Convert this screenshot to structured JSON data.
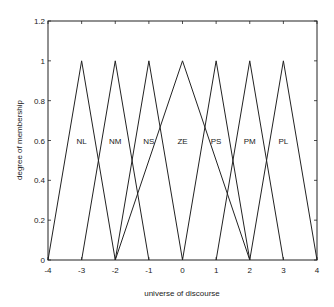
{
  "chart_data": {
    "type": "line",
    "title": "",
    "xlabel": "universe of discourse",
    "ylabel": "degree of membership",
    "xlim": [
      -4,
      4
    ],
    "ylim": [
      0,
      1.2
    ],
    "xticks": [
      -4,
      -3,
      -2,
      -1,
      0,
      1,
      2,
      3,
      4
    ],
    "xtick_labels": [
      "-4",
      "-3",
      "-2",
      "-1",
      "0",
      "1",
      "2",
      "3",
      "4"
    ],
    "yticks": [
      0,
      0.2,
      0.4,
      0.6,
      0.8,
      1,
      1.2
    ],
    "ytick_labels": [
      "0",
      "0.2",
      "0.4",
      "0.6",
      "0.8",
      "1",
      "1.2"
    ],
    "grid": false,
    "legend": "none (labels placed inside plot)",
    "series": [
      {
        "name": "NL",
        "x": [
          -4,
          -3,
          -2
        ],
        "y": [
          0,
          1,
          0
        ],
        "label_pos": [
          -3,
          0.6
        ]
      },
      {
        "name": "NM",
        "x": [
          -3,
          -2,
          -1
        ],
        "y": [
          0,
          1,
          0
        ],
        "label_pos": [
          -2,
          0.6
        ]
      },
      {
        "name": "NS",
        "x": [
          -2,
          -1,
          0
        ],
        "y": [
          0,
          1,
          0
        ],
        "label_pos": [
          -1,
          0.6
        ]
      },
      {
        "name": "ZE",
        "x": [
          -2,
          0,
          2
        ],
        "y": [
          0,
          1,
          0
        ],
        "label_pos": [
          0,
          0.6
        ]
      },
      {
        "name": "PS",
        "x": [
          0,
          1,
          2
        ],
        "y": [
          0,
          1,
          0
        ],
        "label_pos": [
          1,
          0.6
        ]
      },
      {
        "name": "PM",
        "x": [
          1,
          2,
          3
        ],
        "y": [
          0,
          1,
          0
        ],
        "label_pos": [
          2,
          0.6
        ]
      },
      {
        "name": "PL",
        "x": [
          2,
          3,
          4
        ],
        "y": [
          0,
          1,
          0
        ],
        "label_pos": [
          3,
          0.6
        ]
      }
    ],
    "line_color": "#222222"
  }
}
